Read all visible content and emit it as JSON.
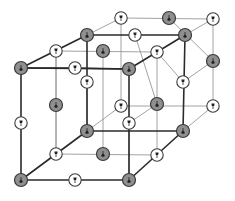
{
  "figure": {
    "title": "",
    "legend": []
  },
  "species": {
    "grey": {
      "label": "",
      "color": "#8f8f8f",
      "spin": "down"
    },
    "white": {
      "label": "",
      "color": "#ffffff",
      "spin": "up"
    }
  },
  "atoms": [
    {
      "id": "a1",
      "type": "white"
    },
    {
      "id": "a2",
      "type": "grey"
    },
    {
      "id": "a3",
      "type": "white"
    },
    {
      "id": "a4",
      "type": "grey"
    },
    {
      "id": "a5",
      "type": "white"
    },
    {
      "id": "a6",
      "type": "grey"
    },
    {
      "id": "a7",
      "type": "white"
    },
    {
      "id": "a8",
      "type": "grey"
    },
    {
      "id": "a9",
      "type": "white"
    },
    {
      "id": "a10",
      "type": "grey"
    },
    {
      "id": "a11",
      "type": "white"
    },
    {
      "id": "a12",
      "type": "grey"
    },
    {
      "id": "a13",
      "type": "white"
    },
    {
      "id": "a14",
      "type": "white"
    },
    {
      "id": "a15",
      "type": "grey"
    },
    {
      "id": "a16",
      "type": "white"
    },
    {
      "id": "a17",
      "type": "grey"
    },
    {
      "id": "a18",
      "type": "white"
    },
    {
      "id": "a19",
      "type": "white"
    },
    {
      "id": "a20",
      "type": "white"
    },
    {
      "id": "a21",
      "type": "grey"
    },
    {
      "id": "a22",
      "type": "grey"
    },
    {
      "id": "a23",
      "type": "white"
    },
    {
      "id": "a24",
      "type": "grey"
    },
    {
      "id": "a25",
      "type": "white"
    },
    {
      "id": "a26",
      "type": "grey"
    },
    {
      "id": "a27",
      "type": "white"
    },
    {
      "id": "a28",
      "type": "grey"
    }
  ]
}
